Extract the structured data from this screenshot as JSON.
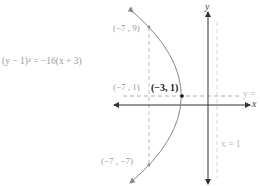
{
  "equation": "(y − 1)² = −16(x + 3)",
  "points": {
    "top": {
      "label": "(−7 , 9)",
      "x": -7,
      "y": 9
    },
    "focus": {
      "label": "(−7 , 1)",
      "x": -7,
      "y": 1
    },
    "vertex": {
      "label": "(−3, 1)",
      "x": -3,
      "y": 1
    },
    "bottom": {
      "label": "(−7 , −7)",
      "x": -7,
      "y": -7
    }
  },
  "axes": {
    "x_label": "x",
    "y_label": "y"
  },
  "lines": {
    "axis_of_symmetry": "y =",
    "directrix": "x = 1"
  },
  "colors": {
    "curve": "#888888",
    "axes": "#333333",
    "dashed": "#aaaaaa",
    "directrix": "#c8c8c8",
    "vertex": "#111111"
  }
}
